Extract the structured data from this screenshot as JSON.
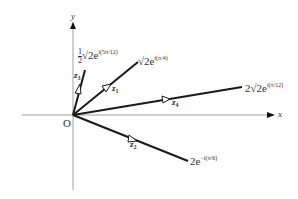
{
  "diagram": {
    "axes": {
      "x_label": "x",
      "y_label": "y",
      "origin_label": "O"
    },
    "vectors": [
      {
        "id": "z1",
        "name": "z",
        "sub": "1",
        "coef": "",
        "root": "√",
        "base": "2e",
        "exponent": "i(π/4)"
      },
      {
        "id": "z2",
        "name": "z",
        "sub": "2",
        "coef": "2",
        "root": "",
        "base": "e",
        "exponent": "−i(π/6)"
      },
      {
        "id": "z3",
        "name": "z",
        "sub": "3",
        "coef_num": "1",
        "coef_den": "2",
        "root": "√",
        "base": "2e",
        "exponent": "i(5π/12)"
      },
      {
        "id": "z4",
        "name": "z",
        "sub": "4",
        "coef": "2",
        "root": "√",
        "base": "2e",
        "exponent": "i(π/12)"
      }
    ],
    "colors": {
      "line": "#1a1a1a",
      "axis": "#777777",
      "background": "#ffffff"
    }
  }
}
